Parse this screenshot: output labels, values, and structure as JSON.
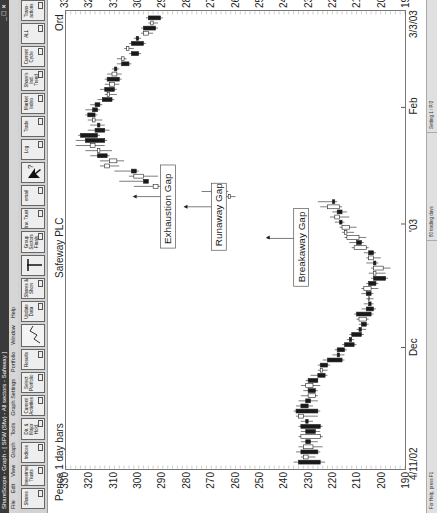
{
  "window": {
    "title": "ShareScope - Graph - [ SFW (Sfw) - All sectors - Safeway ]",
    "controls": "_ ☐ ✕"
  },
  "menu": [
    "File",
    "Edit",
    "View",
    "Graph",
    "Tools",
    "Graph Settings",
    "Portfolio",
    "Window",
    "Help"
  ],
  "toolbar": [
    {
      "label": "Shares",
      "name": "shares"
    },
    {
      "label": "Investment Trusts",
      "name": "investment-trusts"
    },
    {
      "label": "Indices",
      "name": "indices"
    },
    {
      "label": "Dir. & Major Hold.",
      "name": "directors-major-holders"
    },
    {
      "label": "Current Activities",
      "name": "current-activities"
    },
    {
      "label": "Select Portfolio",
      "name": "select-portfolio"
    },
    {
      "label": "Results",
      "name": "results"
    },
    {
      "label": "",
      "name": "graph"
    },
    {
      "label": "Update Data",
      "name": "update-data"
    },
    {
      "label": "Shares & Show",
      "name": "shares-show"
    },
    {
      "label": "",
      "name": "candle-marker"
    },
    {
      "label": "Group Sectors Finals",
      "name": "group-sectors"
    },
    {
      "label": "Inv. Trust",
      "name": "inv-trust"
    },
    {
      "label": "email",
      "name": "email"
    },
    {
      "label": "",
      "name": "help-pointer"
    },
    {
      "label": "Log",
      "name": "log"
    },
    {
      "label": "Trade",
      "name": "trade"
    },
    {
      "label": "Market Index",
      "name": "market-index"
    },
    {
      "label": "Share's Ind. Trend",
      "name": "shares-ind-trend"
    },
    {
      "label": "Current Cycle",
      "name": "current-cycle"
    },
    {
      "label": "ALL",
      "name": "all"
    },
    {
      "label": "Trans-actions",
      "name": "transactions"
    }
  ],
  "chart_header": {
    "left": "Pence 1 day bars",
    "center": "Safeway PLC",
    "right": "Ord"
  },
  "status": {
    "help": "For Help, press F1",
    "trading_days": "80 trading days",
    "setting": "Setting 1 / P/2"
  },
  "chart_data": {
    "type": "candlestick",
    "title": "Safeway PLC",
    "subtitle": "Pence 1 day bars",
    "ylabel": "Pence",
    "ylim": [
      190,
      330
    ],
    "yticks": [
      190,
      200,
      210,
      220,
      230,
      240,
      250,
      260,
      270,
      280,
      290,
      300,
      310,
      320,
      330
    ],
    "xticks": [
      {
        "label": "4/11/02",
        "pos": 0.0
      },
      {
        "label": "Dec",
        "pos": 0.265
      },
      {
        "label": "'03",
        "pos": 0.535
      },
      {
        "label": "Feb",
        "pos": 0.79
      },
      {
        "label": "3/3/03",
        "pos": 1.0
      }
    ],
    "annotations": [
      {
        "text": "Breakaway Gap",
        "bar": 44,
        "price": 245
      },
      {
        "text": "Runaway Gap",
        "bar": 50,
        "price": 279
      },
      {
        "text": "Exhaustion Gap",
        "bar": 52,
        "price": 300
      }
    ],
    "bars": [
      {
        "o": 234,
        "h": 236,
        "l": 223,
        "c": 225
      },
      {
        "o": 230,
        "h": 233,
        "l": 227,
        "c": 232
      },
      {
        "o": 233,
        "h": 235,
        "l": 225,
        "c": 226
      },
      {
        "o": 228,
        "h": 234,
        "l": 224,
        "c": 232
      },
      {
        "o": 231,
        "h": 233,
        "l": 226,
        "c": 229
      },
      {
        "o": 225,
        "h": 234,
        "l": 224,
        "c": 233
      },
      {
        "o": 231,
        "h": 233,
        "l": 225,
        "c": 227
      },
      {
        "o": 233,
        "h": 234,
        "l": 224,
        "c": 225
      },
      {
        "o": 231,
        "h": 233,
        "l": 228,
        "c": 230
      },
      {
        "o": 232,
        "h": 235,
        "l": 226,
        "c": 234
      },
      {
        "o": 235,
        "h": 236,
        "l": 225,
        "c": 226
      },
      {
        "o": 233,
        "h": 235,
        "l": 228,
        "c": 230
      },
      {
        "o": 231,
        "h": 234,
        "l": 226,
        "c": 229
      },
      {
        "o": 227,
        "h": 233,
        "l": 226,
        "c": 230
      },
      {
        "o": 230,
        "h": 232,
        "l": 226,
        "c": 227
      },
      {
        "o": 228,
        "h": 233,
        "l": 225,
        "c": 231
      },
      {
        "o": 230,
        "h": 231,
        "l": 226,
        "c": 226
      },
      {
        "o": 226,
        "h": 229,
        "l": 222,
        "c": 223
      },
      {
        "o": 224,
        "h": 226,
        "l": 222,
        "c": 225
      },
      {
        "o": 225,
        "h": 226,
        "l": 221,
        "c": 222
      },
      {
        "o": 222,
        "h": 224,
        "l": 215,
        "c": 216
      },
      {
        "o": 218,
        "h": 220,
        "l": 215,
        "c": 217
      },
      {
        "o": 218,
        "h": 219,
        "l": 214,
        "c": 215
      },
      {
        "o": 215,
        "h": 216,
        "l": 210,
        "c": 211
      },
      {
        "o": 213,
        "h": 214,
        "l": 211,
        "c": 212
      },
      {
        "o": 212,
        "h": 213,
        "l": 207,
        "c": 208
      },
      {
        "o": 209,
        "h": 210,
        "l": 206,
        "c": 208
      },
      {
        "o": 208,
        "h": 209,
        "l": 205,
        "c": 206
      },
      {
        "o": 206,
        "h": 210,
        "l": 205,
        "c": 209
      },
      {
        "o": 210,
        "h": 211,
        "l": 203,
        "c": 204
      },
      {
        "o": 206,
        "h": 208,
        "l": 202,
        "c": 203
      },
      {
        "o": 205,
        "h": 207,
        "l": 203,
        "c": 204
      },
      {
        "o": 205,
        "h": 206,
        "l": 203,
        "c": 205
      },
      {
        "o": 206,
        "h": 208,
        "l": 203,
        "c": 204
      },
      {
        "o": 204,
        "h": 208,
        "l": 201,
        "c": 207
      },
      {
        "o": 205,
        "h": 206,
        "l": 201,
        "c": 202
      },
      {
        "o": 203,
        "h": 204,
        "l": 197,
        "c": 198
      },
      {
        "o": 202,
        "h": 205,
        "l": 198,
        "c": 203
      },
      {
        "o": 199,
        "h": 204,
        "l": 196,
        "c": 203
      },
      {
        "o": 203,
        "h": 206,
        "l": 201,
        "c": 202
      },
      {
        "o": 203,
        "h": 206,
        "l": 200,
        "c": 205
      },
      {
        "o": 205,
        "h": 207,
        "l": 202,
        "c": 203
      },
      {
        "o": 206,
        "h": 212,
        "l": 205,
        "c": 211
      },
      {
        "o": 210,
        "h": 213,
        "l": 207,
        "c": 208
      },
      {
        "o": 209,
        "h": 215,
        "l": 206,
        "c": 214
      },
      {
        "o": 214,
        "h": 216,
        "l": 211,
        "c": 215
      },
      {
        "o": 213,
        "h": 217,
        "l": 210,
        "c": 216
      },
      {
        "o": 217,
        "h": 219,
        "l": 215,
        "c": 216
      },
      {
        "o": 217,
        "h": 221,
        "l": 213,
        "c": 219
      },
      {
        "o": 218,
        "h": 220,
        "l": 214,
        "c": 216
      },
      {
        "o": 217,
        "h": 225,
        "l": 216,
        "c": 222
      },
      {
        "o": 220,
        "h": 226,
        "l": 218,
        "c": 219
      },
      {
        "o": 262,
        "h": 268,
        "l": 260,
        "c": 263
      },
      {
        "o": 267,
        "h": 274,
        "l": 263,
        "c": 270
      },
      {
        "o": 292,
        "h": 302,
        "l": 290,
        "c": 294
      },
      {
        "o": 298,
        "h": 308,
        "l": 296,
        "c": 296
      },
      {
        "o": 298,
        "h": 304,
        "l": 292,
        "c": 302
      },
      {
        "o": 303,
        "h": 310,
        "l": 300,
        "c": 301
      },
      {
        "o": 312,
        "h": 316,
        "l": 308,
        "c": 314
      },
      {
        "o": 309,
        "h": 316,
        "l": 306,
        "c": 312
      },
      {
        "o": 317,
        "h": 320,
        "l": 312,
        "c": 313
      },
      {
        "o": 316,
        "h": 322,
        "l": 311,
        "c": 317
      },
      {
        "o": 318,
        "h": 326,
        "l": 314,
        "c": 320
      },
      {
        "o": 322,
        "h": 326,
        "l": 313,
        "c": 314
      },
      {
        "o": 324,
        "h": 325,
        "l": 316,
        "c": 317
      },
      {
        "o": 318,
        "h": 321,
        "l": 312,
        "c": 314
      },
      {
        "o": 317,
        "h": 320,
        "l": 314,
        "c": 316
      },
      {
        "o": 318,
        "h": 321,
        "l": 315,
        "c": 319
      },
      {
        "o": 321,
        "h": 322,
        "l": 317,
        "c": 318
      },
      {
        "o": 319,
        "h": 322,
        "l": 316,
        "c": 317
      },
      {
        "o": 318,
        "h": 320,
        "l": 315,
        "c": 316
      },
      {
        "o": 315,
        "h": 317,
        "l": 310,
        "c": 311
      },
      {
        "o": 312,
        "h": 314,
        "l": 309,
        "c": 313
      },
      {
        "o": 314,
        "h": 316,
        "l": 309,
        "c": 310
      },
      {
        "o": 310,
        "h": 314,
        "l": 308,
        "c": 312
      },
      {
        "o": 313,
        "h": 314,
        "l": 307,
        "c": 308
      },
      {
        "o": 309,
        "h": 313,
        "l": 307,
        "c": 311
      },
      {
        "o": 310,
        "h": 311,
        "l": 308,
        "c": 309
      },
      {
        "o": 307,
        "h": 309,
        "l": 303,
        "c": 304
      },
      {
        "o": 306,
        "h": 309,
        "l": 305,
        "c": 307
      },
      {
        "o": 303,
        "h": 304,
        "l": 299,
        "c": 300
      },
      {
        "o": 304,
        "h": 306,
        "l": 302,
        "c": 305
      },
      {
        "o": 303,
        "h": 304,
        "l": 297,
        "c": 298
      },
      {
        "o": 301,
        "h": 302,
        "l": 299,
        "c": 300
      },
      {
        "o": 296,
        "h": 299,
        "l": 294,
        "c": 298
      },
      {
        "o": 298,
        "h": 299,
        "l": 292,
        "c": 293
      },
      {
        "o": 294,
        "h": 296,
        "l": 292,
        "c": 295
      },
      {
        "o": 296,
        "h": 297,
        "l": 290,
        "c": 291
      }
    ]
  }
}
